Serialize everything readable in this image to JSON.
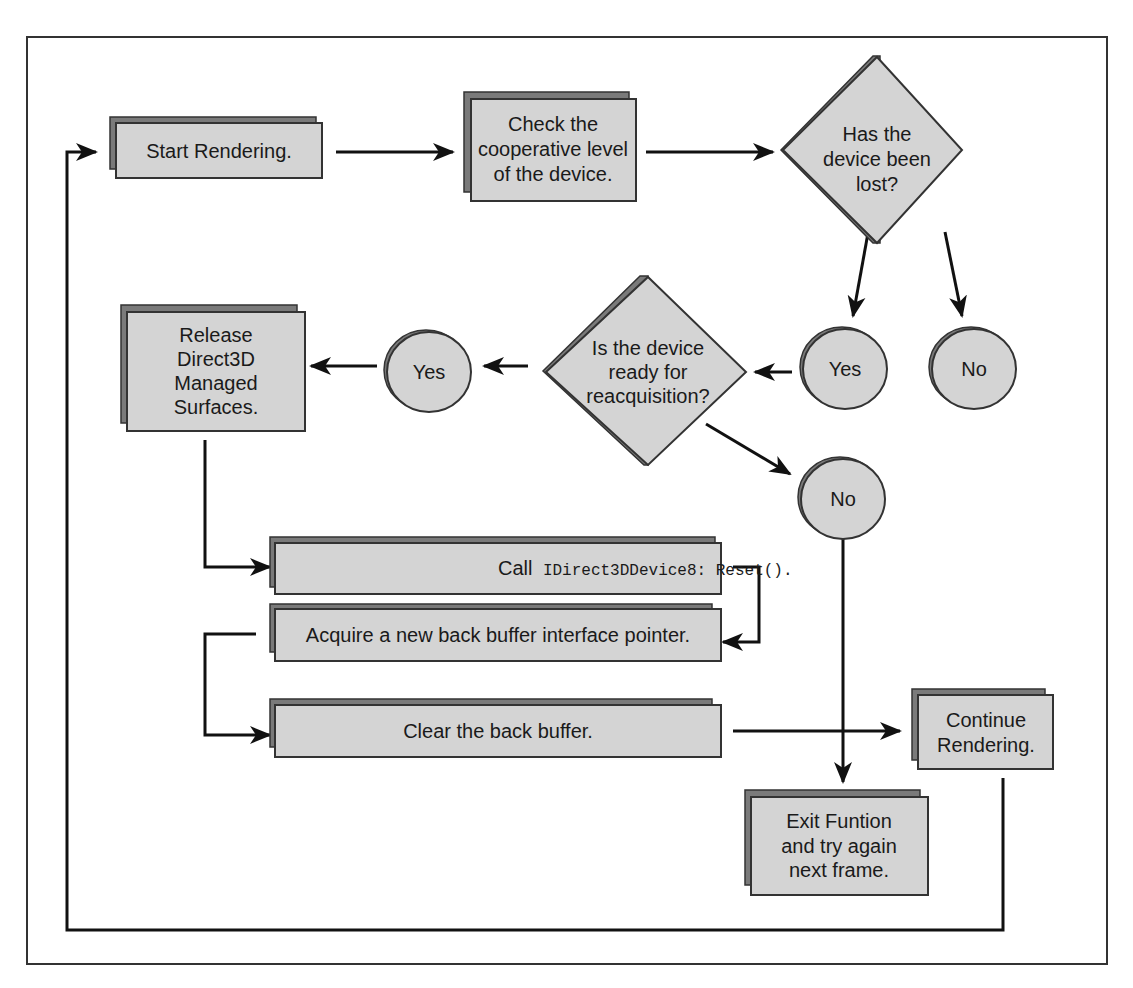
{
  "diagram": {
    "nodes": {
      "start": {
        "label": "Start Rendering."
      },
      "check": {
        "lines": [
          "Check the",
          "cooperative level",
          "of the device."
        ]
      },
      "lost_decision": {
        "lines": [
          "Has the",
          "device been",
          "lost?"
        ]
      },
      "lost_yes": {
        "label": "Yes"
      },
      "lost_no": {
        "label": "No"
      },
      "ready_decision": {
        "lines": [
          "Is the device",
          "ready for",
          "reacquisition?"
        ]
      },
      "ready_yes": {
        "label": "Yes"
      },
      "ready_no": {
        "label": "No"
      },
      "release": {
        "lines": [
          "Release",
          "Direct3D",
          "Managed",
          "Surfaces."
        ]
      },
      "reset": {
        "prefix": "Call",
        "code": "IDirect3DDevice8: Reset()."
      },
      "acquire": {
        "label": "Acquire a new back buffer interface pointer."
      },
      "clear": {
        "label": "Clear the back buffer."
      },
      "continue": {
        "lines": [
          "Continue",
          "Rendering."
        ]
      },
      "exit": {
        "lines": [
          "Exit Funtion",
          "and try again",
          "next frame."
        ]
      }
    },
    "colors": {
      "box_fill": "#d4d4d4",
      "box_shadow": "#7a7a7a",
      "stroke": "#333333",
      "arrow": "#111111"
    }
  }
}
